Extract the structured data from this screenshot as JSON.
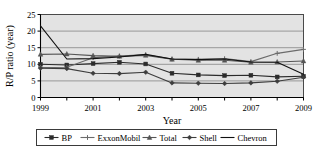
{
  "chart_data": {
    "type": "line",
    "title": "",
    "xlabel": "Year",
    "ylabel": "R/P ratio (year)",
    "x": [
      1999,
      2000,
      2001,
      2002,
      2003,
      2004,
      2005,
      2006,
      2007,
      2008,
      2009
    ],
    "xlim": [
      1999,
      2009
    ],
    "ylim": [
      0,
      25
    ],
    "yticks": [
      0,
      5,
      10,
      15,
      20,
      25
    ],
    "xticks": [
      1999,
      2000,
      2001,
      2002,
      2003,
      2004,
      2005,
      2006,
      2007,
      2008,
      2009
    ],
    "xtick_labels": [
      "1999",
      "",
      "2001",
      "",
      "2003",
      "",
      "2005",
      "",
      "2007",
      "",
      "2009"
    ],
    "ytick_labels": [
      "0",
      "5",
      "10",
      "15",
      "20",
      "25"
    ],
    "grid": "horizontal",
    "legend_position": "bottom",
    "plot_background": "#e3e3e3",
    "series": [
      {
        "name": "BP",
        "marker": "square",
        "color": "#2b2b2b",
        "values": [
          10.0,
          9.8,
          10.2,
          10.6,
          10.1,
          7.3,
          6.8,
          6.6,
          6.7,
          6.2,
          6.4
        ]
      },
      {
        "name": "ExxonMobil",
        "marker": "cross",
        "color": "#6b6b6b",
        "values": [
          9.0,
          9.1,
          12.0,
          12.5,
          12.9,
          11.6,
          11.5,
          11.7,
          10.8,
          13.3,
          14.5
        ]
      },
      {
        "name": "Total",
        "marker": "triangle",
        "color": "#555555",
        "values": [
          13.0,
          13.1,
          12.6,
          12.4,
          12.7,
          11.5,
          11.2,
          11.2,
          10.6,
          10.7,
          11.0
        ]
      },
      {
        "name": "Shell",
        "marker": "diamond",
        "color": "#3d3d3d",
        "values": [
          8.8,
          8.7,
          7.3,
          7.2,
          7.6,
          4.4,
          4.3,
          4.2,
          4.4,
          4.9,
          6.1
        ]
      },
      {
        "name": "Chevron",
        "marker": "none",
        "color": "#111111",
        "values": [
          21.6,
          11.6,
          11.7,
          12.2,
          13.0,
          11.6,
          11.4,
          11.6,
          10.7,
          10.6,
          7.0
        ]
      }
    ]
  },
  "legend": {
    "items": [
      {
        "label": "BP"
      },
      {
        "label": "ExxonMobil"
      },
      {
        "label": "Total"
      },
      {
        "label": "Shell"
      },
      {
        "label": "Chevron"
      }
    ]
  }
}
